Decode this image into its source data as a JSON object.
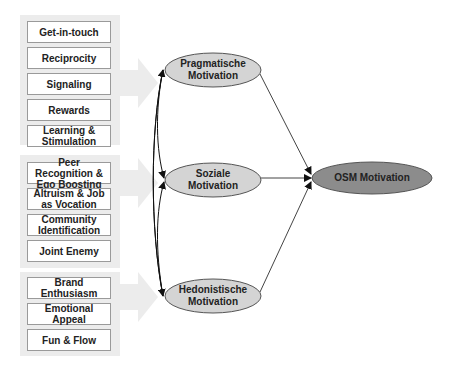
{
  "groups": [
    {
      "items": [
        "Get-in-touch",
        "Reciprocity",
        "Signaling",
        "Rewards",
        "Learning & Stimulation"
      ]
    },
    {
      "items": [
        "Peer Recognition & Ego Boosting",
        "Altruism & Job as Vocation",
        "Community Identification",
        "Joint Enemy"
      ]
    },
    {
      "items": [
        "Brand Enthusiasm",
        "Emotional Appeal",
        "Fun & Flow"
      ]
    }
  ],
  "nodes": {
    "pragmatic": {
      "line1": "Pragmatische",
      "line2": "Motivation"
    },
    "social": {
      "line1": "Soziale",
      "line2": "Motivation"
    },
    "hedonic": {
      "line1": "Hedonistische",
      "line2": "Motivation"
    },
    "osm": {
      "label": "OSM Motivation"
    }
  },
  "colors": {
    "ellipse_light": "#d4d4d4",
    "ellipse_dark": "#8c8c8c",
    "group_bg": "#ececec"
  }
}
